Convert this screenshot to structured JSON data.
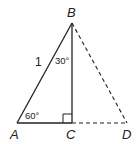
{
  "diagram": {
    "type": "geometry-triangle",
    "points": {
      "A": {
        "label": "A",
        "x": 17,
        "y": 123
      },
      "B": {
        "label": "B",
        "x": 72,
        "y": 23
      },
      "C": {
        "label": "C",
        "x": 72,
        "y": 123
      },
      "D": {
        "label": "D",
        "x": 127,
        "y": 123
      }
    },
    "segments": [
      {
        "from": "A",
        "to": "B",
        "style": "solid"
      },
      {
        "from": "B",
        "to": "C",
        "style": "solid"
      },
      {
        "from": "A",
        "to": "C",
        "style": "solid"
      },
      {
        "from": "B",
        "to": "D",
        "style": "dashed"
      },
      {
        "from": "C",
        "to": "D",
        "style": "dashed"
      }
    ],
    "labels": {
      "side_AB": "1",
      "angle_A": "60°",
      "angle_B": "30°"
    },
    "right_angle_at": "C",
    "colors": {
      "stroke": "#222222",
      "background": "#ffffff"
    }
  }
}
